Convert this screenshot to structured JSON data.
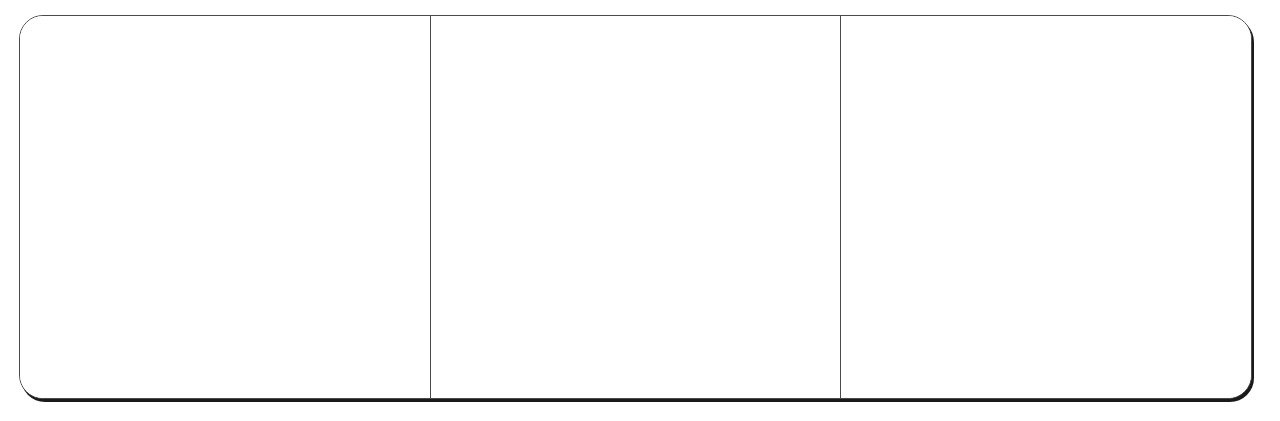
{
  "layout": {
    "panel_count": 3,
    "border_color": "#4a4a4a",
    "shadow_color": "#1a1a1a"
  },
  "panels": [
    {
      "content": ""
    },
    {
      "content": ""
    },
    {
      "content": ""
    }
  ]
}
